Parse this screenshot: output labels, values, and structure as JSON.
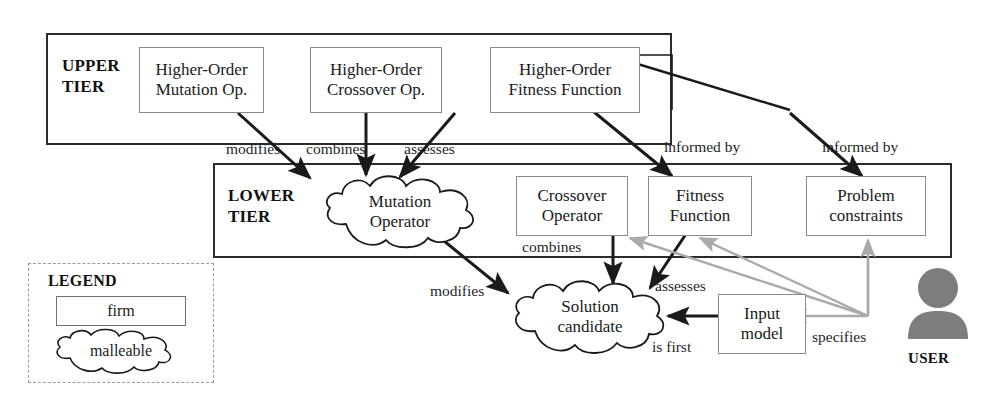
{
  "diagram": {
    "colors": {
      "ink": "#1a1a1a",
      "tier_border": "#2b2b2b",
      "firm_border": "#8a8a8a",
      "legend_border": "#9a9a9a",
      "user_gray": "#7d7d7d",
      "gray_arrow": "#a9a9a9",
      "black_arrow": "#1a1a1a"
    }
  },
  "tiers": {
    "upper": {
      "label_line1": "UPPER",
      "label_line2": "TIER"
    },
    "lower": {
      "label_line1": "LOWER",
      "label_line2": "TIER"
    }
  },
  "upper_nodes": [
    {
      "id": "ho-mutation",
      "line1": "Higher-Order",
      "line2": "Mutation Op.",
      "shape": "firm"
    },
    {
      "id": "ho-crossover",
      "line1": "Higher-Order",
      "line2": "Crossover Op.",
      "shape": "firm"
    },
    {
      "id": "ho-fitness",
      "line1": "Higher-Order",
      "line2": "Fitness Function",
      "shape": "firm"
    }
  ],
  "lower_nodes": [
    {
      "id": "mutation-operator",
      "line1": "Mutation",
      "line2": "Operator",
      "shape": "malleable"
    },
    {
      "id": "crossover-operator",
      "line1": "Crossover",
      "line2": "Operator",
      "shape": "firm"
    },
    {
      "id": "fitness-function",
      "line1": "Fitness",
      "line2": "Function",
      "shape": "firm"
    },
    {
      "id": "problem-constraints",
      "line1": "Problem",
      "line2": "constraints",
      "shape": "firm"
    }
  ],
  "bottom_nodes": [
    {
      "id": "solution-candidate",
      "line1": "Solution",
      "line2": "candidate",
      "shape": "malleable"
    },
    {
      "id": "input-model",
      "line1": "Input",
      "line2": "model",
      "shape": "firm"
    }
  ],
  "edge_labels": {
    "modifies_upper": "modifies",
    "combines_upper": "combines",
    "assesses_upper": "assesses",
    "informed_by_1": "informed by",
    "informed_by_2": "informed by",
    "combines_lower": "combines",
    "modifies_lower": "modifies",
    "assesses_lower": "assesses",
    "is_first": "is first",
    "specifies": "specifies"
  },
  "legend": {
    "title": "LEGEND",
    "firm_label": "firm",
    "malleable_label": "malleable"
  },
  "user": {
    "label": "USER",
    "icon": "user-avatar-icon"
  }
}
